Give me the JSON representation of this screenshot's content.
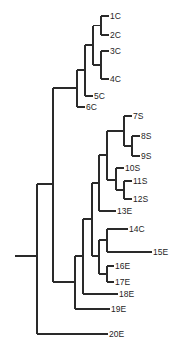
{
  "diagram": {
    "type": "dendrogram",
    "orientation": "left-to-right",
    "root": {
      "x": 15,
      "y": 256
    },
    "leaves": [
      {
        "label": "1C",
        "y": 16,
        "x_end": 109
      },
      {
        "label": "2C",
        "y": 35,
        "x_end": 109
      },
      {
        "label": "3C",
        "y": 51,
        "x_end": 109
      },
      {
        "label": "4C",
        "y": 79,
        "x_end": 109
      },
      {
        "label": "5C",
        "y": 96,
        "x_end": 93
      },
      {
        "label": "6C",
        "y": 107,
        "x_end": 85
      },
      {
        "label": "7S",
        "y": 116,
        "x_end": 132
      },
      {
        "label": "8S",
        "y": 136,
        "x_end": 140
      },
      {
        "label": "9S",
        "y": 156,
        "x_end": 140
      },
      {
        "label": "10S",
        "y": 168,
        "x_end": 124
      },
      {
        "label": "11S",
        "y": 181,
        "x_end": 132
      },
      {
        "label": "12S",
        "y": 199,
        "x_end": 132
      },
      {
        "label": "13E",
        "y": 211,
        "x_end": 116
      },
      {
        "label": "14C",
        "y": 229,
        "x_end": 128
      },
      {
        "label": "15E",
        "y": 252,
        "x_end": 152
      },
      {
        "label": "16E",
        "y": 266,
        "x_end": 114
      },
      {
        "label": "17E",
        "y": 282,
        "x_end": 114
      },
      {
        "label": "18E",
        "y": 294,
        "x_end": 118
      },
      {
        "label": "19E",
        "y": 309,
        "x_end": 110
      },
      {
        "label": "20E",
        "y": 334,
        "x_end": 108
      }
    ],
    "edges": [
      {
        "x1": 15,
        "y1": 256,
        "x2": 37,
        "y2": 256
      },
      {
        "x1": 37,
        "y1": 184,
        "x2": 37,
        "y2": 334
      },
      {
        "x1": 37,
        "y1": 334,
        "x2": 108,
        "y2": 334
      },
      {
        "x1": 37,
        "y1": 184,
        "x2": 53,
        "y2": 184
      },
      {
        "x1": 53,
        "y1": 88,
        "x2": 53,
        "y2": 282
      },
      {
        "x1": 53,
        "y1": 88,
        "x2": 77,
        "y2": 88
      },
      {
        "x1": 77,
        "y1": 70,
        "x2": 77,
        "y2": 107
      },
      {
        "x1": 77,
        "y1": 107,
        "x2": 85,
        "y2": 107
      },
      {
        "x1": 77,
        "y1": 70,
        "x2": 85,
        "y2": 70
      },
      {
        "x1": 85,
        "y1": 45,
        "x2": 85,
        "y2": 96
      },
      {
        "x1": 85,
        "y1": 96,
        "x2": 93,
        "y2": 96
      },
      {
        "x1": 85,
        "y1": 45,
        "x2": 93,
        "y2": 45
      },
      {
        "x1": 93,
        "y1": 25.5,
        "x2": 93,
        "y2": 65
      },
      {
        "x1": 93,
        "y1": 25.5,
        "x2": 101,
        "y2": 25.5
      },
      {
        "x1": 93,
        "y1": 65,
        "x2": 101,
        "y2": 65
      },
      {
        "x1": 101,
        "y1": 16,
        "x2": 101,
        "y2": 35
      },
      {
        "x1": 101,
        "y1": 16,
        "x2": 109,
        "y2": 16
      },
      {
        "x1": 101,
        "y1": 35,
        "x2": 109,
        "y2": 35
      },
      {
        "x1": 101,
        "y1": 51,
        "x2": 101,
        "y2": 79
      },
      {
        "x1": 101,
        "y1": 51,
        "x2": 109,
        "y2": 51
      },
      {
        "x1": 101,
        "y1": 79,
        "x2": 109,
        "y2": 79
      },
      {
        "x1": 53,
        "y1": 282,
        "x2": 75,
        "y2": 282
      },
      {
        "x1": 75,
        "y1": 256,
        "x2": 75,
        "y2": 309
      },
      {
        "x1": 75,
        "y1": 309,
        "x2": 110,
        "y2": 309
      },
      {
        "x1": 75,
        "y1": 256,
        "x2": 83,
        "y2": 256
      },
      {
        "x1": 83,
        "y1": 219,
        "x2": 83,
        "y2": 294
      },
      {
        "x1": 83,
        "y1": 294,
        "x2": 118,
        "y2": 294
      },
      {
        "x1": 83,
        "y1": 219,
        "x2": 92,
        "y2": 219
      },
      {
        "x1": 92,
        "y1": 183,
        "x2": 92,
        "y2": 256
      },
      {
        "x1": 92,
        "y1": 183,
        "x2": 99,
        "y2": 183
      },
      {
        "x1": 92,
        "y1": 256,
        "x2": 99,
        "y2": 256
      },
      {
        "x1": 99,
        "y1": 155,
        "x2": 99,
        "y2": 211
      },
      {
        "x1": 99,
        "y1": 211,
        "x2": 116,
        "y2": 211
      },
      {
        "x1": 99,
        "y1": 155,
        "x2": 107,
        "y2": 155
      },
      {
        "x1": 107,
        "y1": 131,
        "x2": 107,
        "y2": 180
      },
      {
        "x1": 107,
        "y1": 131,
        "x2": 124,
        "y2": 131
      },
      {
        "x1": 107,
        "y1": 180,
        "x2": 116,
        "y2": 180
      },
      {
        "x1": 124,
        "y1": 116,
        "x2": 124,
        "y2": 146
      },
      {
        "x1": 124,
        "y1": 116,
        "x2": 132,
        "y2": 116
      },
      {
        "x1": 124,
        "y1": 146,
        "x2": 132,
        "y2": 146
      },
      {
        "x1": 132,
        "y1": 136,
        "x2": 132,
        "y2": 156
      },
      {
        "x1": 132,
        "y1": 136,
        "x2": 140,
        "y2": 136
      },
      {
        "x1": 132,
        "y1": 156,
        "x2": 140,
        "y2": 156
      },
      {
        "x1": 116,
        "y1": 168,
        "x2": 116,
        "y2": 190
      },
      {
        "x1": 116,
        "y1": 168,
        "x2": 124,
        "y2": 168
      },
      {
        "x1": 116,
        "y1": 190,
        "x2": 124,
        "y2": 190
      },
      {
        "x1": 124,
        "y1": 181,
        "x2": 124,
        "y2": 199
      },
      {
        "x1": 124,
        "y1": 181,
        "x2": 132,
        "y2": 181
      },
      {
        "x1": 124,
        "y1": 199,
        "x2": 132,
        "y2": 199
      },
      {
        "x1": 99,
        "y1": 240,
        "x2": 99,
        "y2": 274
      },
      {
        "x1": 99,
        "y1": 240,
        "x2": 107,
        "y2": 240
      },
      {
        "x1": 99,
        "y1": 274,
        "x2": 107,
        "y2": 274
      },
      {
        "x1": 107,
        "y1": 229,
        "x2": 107,
        "y2": 252
      },
      {
        "x1": 107,
        "y1": 229,
        "x2": 128,
        "y2": 229
      },
      {
        "x1": 107,
        "y1": 252,
        "x2": 152,
        "y2": 252
      },
      {
        "x1": 107,
        "y1": 266,
        "x2": 107,
        "y2": 282
      },
      {
        "x1": 107,
        "y1": 266,
        "x2": 114,
        "y2": 266
      },
      {
        "x1": 107,
        "y1": 282,
        "x2": 114,
        "y2": 282
      }
    ],
    "colors": {
      "line": "#2a2a2a",
      "text": "#1e1e1e",
      "background": "#ffffff"
    }
  }
}
